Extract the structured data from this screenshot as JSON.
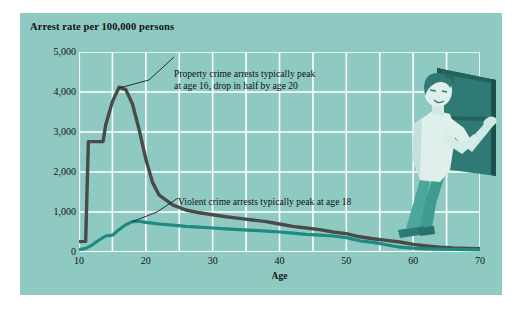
{
  "figure": {
    "title": "Arrest rate per 100,000 persons",
    "background_color": "#8ecac2",
    "gridline_color": "#ffffff",
    "illustration_name": "person-opening-window"
  },
  "annotations": {
    "property": "Property crime arrests typically peak\nat age 16, drop in half by age 20",
    "violent": "Violent crime arrests typically peak at age 18"
  },
  "chart_data": {
    "type": "line",
    "title": "Arrest rate per 100,000 persons",
    "xlabel": "Age",
    "ylabel": "Arrest rate per 100,000 persons",
    "xlim": [
      10,
      70
    ],
    "ylim": [
      0,
      5000
    ],
    "xticks": [
      10,
      20,
      30,
      40,
      50,
      60,
      70
    ],
    "xtick_labels": [
      "10",
      "20",
      "30",
      "40",
      "50",
      "60",
      "70"
    ],
    "yticks": [
      0,
      1000,
      2000,
      3000,
      4000,
      5000
    ],
    "ytick_labels": [
      "0",
      "1,000",
      "2,000",
      "3,000",
      "4,000",
      "5,000"
    ],
    "grid": true,
    "grid_x_step": 5,
    "grid_y_step": 1000,
    "legend": "none",
    "annotations": [
      {
        "text": "Property crime arrests typically peak at age 16, drop in half by age 20",
        "points_to_age": 16,
        "points_to_value": 4100
      },
      {
        "text": "Violent crime arrests typically peak at age 18",
        "points_to_age": 18,
        "points_to_value": 760
      }
    ],
    "series": [
      {
        "name": "Property crime arrests",
        "color": "#4a4a48",
        "x": [
          10,
          11,
          11.4,
          13.6,
          14,
          15,
          16,
          17,
          18,
          19,
          20,
          21,
          22,
          24,
          26,
          28,
          30,
          32,
          34,
          36,
          38,
          40,
          42,
          44,
          46,
          48,
          50,
          52,
          54,
          56,
          58,
          60,
          62,
          64,
          66,
          68,
          70
        ],
        "values": [
          260,
          265,
          2760,
          2760,
          3180,
          3760,
          4120,
          4060,
          3700,
          3060,
          2320,
          1740,
          1420,
          1180,
          1050,
          980,
          930,
          880,
          840,
          800,
          760,
          700,
          640,
          600,
          560,
          500,
          460,
          380,
          330,
          290,
          250,
          190,
          150,
          120,
          100,
          90,
          80
        ]
      },
      {
        "name": "Violent crime arrests",
        "color": "#1e8a80",
        "x": [
          10,
          11,
          12,
          13,
          14,
          15,
          16,
          17,
          18,
          19,
          20,
          21,
          22,
          24,
          26,
          28,
          30,
          32,
          34,
          36,
          38,
          40,
          42,
          44,
          46,
          48,
          50,
          52,
          54,
          56,
          58,
          60,
          62,
          64,
          66,
          68,
          70
        ],
        "values": [
          60,
          90,
          180,
          300,
          400,
          420,
          560,
          680,
          760,
          770,
          740,
          720,
          700,
          670,
          640,
          620,
          600,
          580,
          560,
          540,
          520,
          500,
          470,
          440,
          420,
          400,
          360,
          280,
          240,
          180,
          120,
          95,
          80,
          70,
          65,
          60,
          55
        ]
      }
    ]
  }
}
